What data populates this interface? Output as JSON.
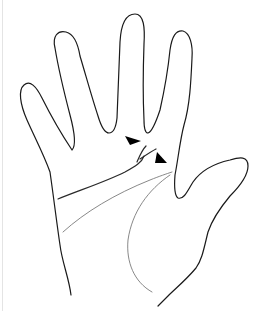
{
  "figure": {
    "subject": "Palm of right hand line drawing with arrowheads indicating palmar creases",
    "hand_side": "palm",
    "fingers": [
      "little",
      "ring",
      "middle",
      "index",
      "thumb"
    ],
    "annotations": [
      {
        "type": "arrowhead",
        "label": "arrowhead-upper",
        "color": "#000000"
      },
      {
        "type": "arrowhead",
        "label": "arrowhead-lower",
        "color": "#000000"
      }
    ],
    "creases": [
      {
        "name": "distal-transverse-crease",
        "style": "dark"
      },
      {
        "name": "crease-branch",
        "style": "dark"
      },
      {
        "name": "proximal-transverse-crease",
        "style": "light"
      },
      {
        "name": "thenar-crease",
        "style": "light"
      }
    ],
    "colors": {
      "background": "#ffffff",
      "outline": "#1a1a1a",
      "light_line": "#7a7a7a",
      "arrow": "#000000"
    }
  }
}
